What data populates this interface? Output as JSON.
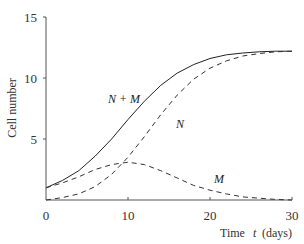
{
  "chart_data": {
    "type": "line",
    "title": "",
    "xlabel": "Time  t (days)",
    "ylabel": "Cell number",
    "xlim": [
      0,
      30
    ],
    "ylim": [
      0,
      15
    ],
    "xticks": [
      0,
      10,
      20,
      30
    ],
    "yticks": [
      5,
      10,
      15
    ],
    "grid": false,
    "legend": "inline labels",
    "x": [
      0,
      2,
      4,
      6,
      8,
      10,
      12,
      14,
      16,
      18,
      20,
      22,
      24,
      26,
      28,
      30
    ],
    "series": [
      {
        "name": "N + M",
        "style": "solid",
        "values": [
          1.0,
          1.6,
          2.4,
          3.6,
          5.0,
          6.6,
          8.1,
          9.4,
          10.4,
          11.1,
          11.6,
          11.9,
          12.05,
          12.15,
          12.2,
          12.2
        ]
      },
      {
        "name": "N",
        "style": "dashed",
        "values": [
          0.0,
          0.2,
          0.5,
          1.1,
          2.1,
          3.5,
          5.2,
          7.0,
          8.6,
          9.9,
          10.8,
          11.4,
          11.8,
          12.0,
          12.15,
          12.2
        ]
      },
      {
        "name": "M",
        "style": "dashed",
        "values": [
          1.0,
          1.4,
          1.9,
          2.5,
          2.9,
          3.1,
          2.9,
          2.4,
          1.8,
          1.2,
          0.8,
          0.5,
          0.25,
          0.15,
          0.05,
          0.0
        ]
      }
    ],
    "annotations": [
      {
        "text": "N + M",
        "x": 9.5,
        "y": 8.2
      },
      {
        "text": "N",
        "x": 16.2,
        "y": 5.9
      },
      {
        "text": "M",
        "x": 21.5,
        "y": 1.3
      }
    ]
  },
  "labels": {
    "ylabel": "Cell number",
    "xlabel_time": "Time",
    "xlabel_var": "t",
    "xlabel_unit": "(days)",
    "xticks": [
      "0",
      "10",
      "20",
      "30"
    ],
    "yticks": [
      "5",
      "10",
      "15"
    ],
    "curve_nm": "N + M",
    "curve_n": "N",
    "curve_m": "M"
  }
}
